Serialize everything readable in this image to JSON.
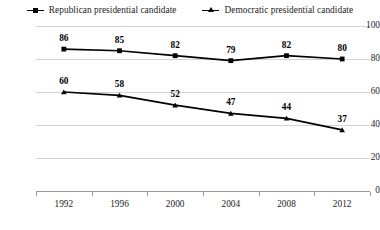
{
  "legend": {
    "position": "top-center",
    "entries": [
      {
        "label": "Republican presidential candidate",
        "marker": "square-marker-icon",
        "color": "#000000"
      },
      {
        "label": "Democratic presidential candidate",
        "marker": "triangle-marker-icon",
        "color": "#000000"
      }
    ]
  },
  "chart_data": {
    "type": "line",
    "title": "",
    "subtitle": "",
    "xlabel": "",
    "ylabel": "",
    "categories": [
      "1992",
      "1996",
      "2000",
      "2004",
      "2008",
      "2012"
    ],
    "x": [
      1992,
      1996,
      2000,
      2004,
      2008,
      2012
    ],
    "series": [
      {
        "name": "Republican presidential candidate",
        "values": [
          86,
          85,
          82,
          79,
          82,
          80
        ],
        "marker": "square",
        "color": "#000000",
        "labels": [
          "86",
          "85",
          "82",
          "79",
          "82",
          "80"
        ]
      },
      {
        "name": "Democratic presidential candidate",
        "values": [
          60,
          58,
          52,
          47,
          44,
          37
        ],
        "marker": "triangle",
        "color": "#000000",
        "labels": [
          "60",
          "58",
          "52",
          "47",
          "44",
          "37"
        ]
      }
    ],
    "ylim": [
      0,
      100
    ],
    "yticks": [
      0,
      20,
      40,
      60,
      80,
      100
    ],
    "ytick_labels": [
      "0",
      "20",
      "40",
      "60",
      "80",
      "100"
    ],
    "xtick_labels": [
      "1992",
      "1996",
      "2000",
      "2004",
      "2008",
      "2012"
    ],
    "grid": {
      "horizontal": true,
      "vertical": false,
      "color": "#d2d2d2"
    },
    "axis_color": "#9a9a9a",
    "background": "#ffffff",
    "legend_position": "top-center"
  }
}
